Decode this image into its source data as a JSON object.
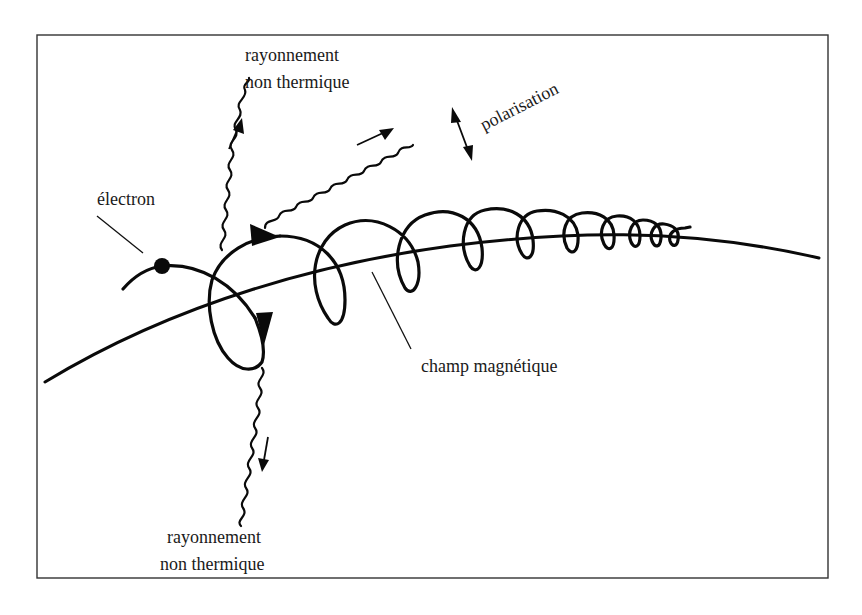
{
  "figure": {
    "frame": {
      "x": 37,
      "y": 35,
      "width": 791,
      "height": 543,
      "stroke": "#333333"
    },
    "colors": {
      "ink": "#0a0a0a",
      "background": "#ffffff"
    }
  },
  "labels": {
    "electron": "électron",
    "radiation_top_line1": "rayonnement",
    "radiation_top_line2": "non thermique",
    "radiation_bottom_line1": "rayonnement",
    "radiation_bottom_line2": "non thermique",
    "polarisation": "polarisation",
    "magnetic_field": "champ magnétique"
  },
  "elements": {
    "electron_dot": {
      "cx": 162,
      "cy": 266,
      "r": 8
    },
    "field_line": {
      "from": [
        45,
        382
      ],
      "to": [
        819,
        258
      ]
    },
    "helix_loops": 10,
    "waves": [
      {
        "name": "wave-top",
        "direction": "up"
      },
      {
        "name": "wave-diagonal",
        "direction": "up-right"
      },
      {
        "name": "wave-bottom",
        "direction": "down"
      }
    ],
    "arrows": [
      {
        "name": "emission-arrow-up",
        "direction": "up"
      },
      {
        "name": "emission-arrow-up-right",
        "direction": "up-right"
      },
      {
        "name": "emission-arrow-down",
        "direction": "down"
      },
      {
        "name": "polarisation-arrow",
        "direction": "double"
      }
    ]
  }
}
